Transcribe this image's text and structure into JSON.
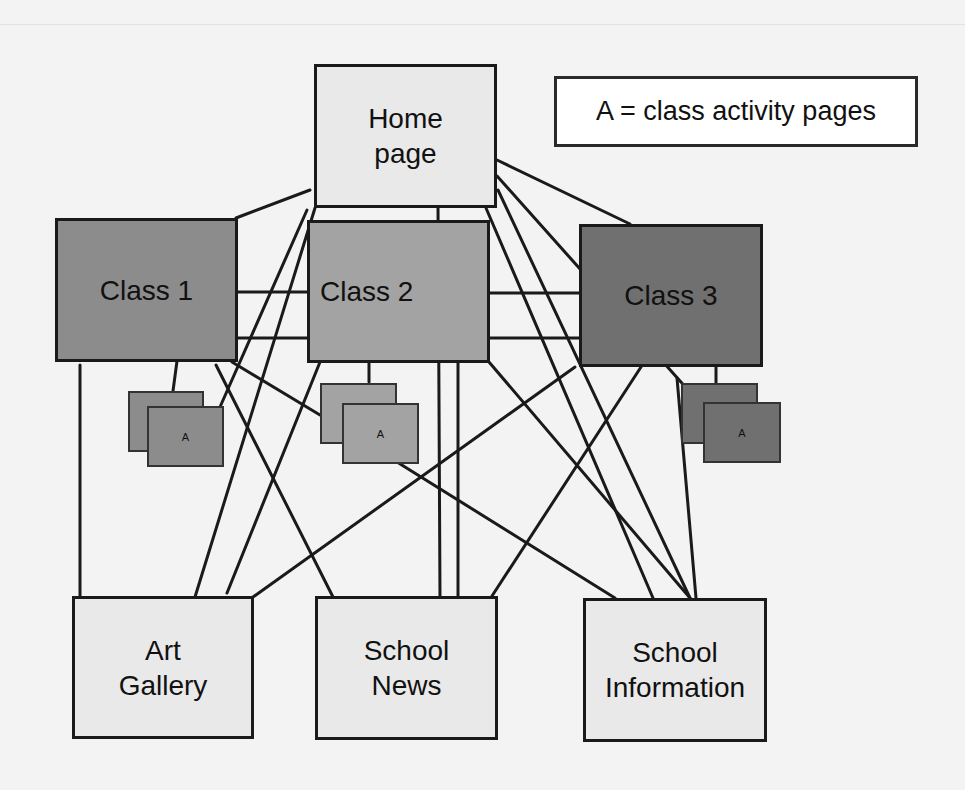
{
  "diagram": {
    "legend": {
      "text": "A = class activity pages"
    },
    "nodes": {
      "home": {
        "label": "Home\npage",
        "color": "#e9e9e9"
      },
      "class1": {
        "label": "Class 1",
        "color": "#8c8c8c"
      },
      "class2": {
        "label": "Class 2",
        "color": "#a3a3a3"
      },
      "class3": {
        "label": "Class 3",
        "color": "#707070"
      },
      "art": {
        "label": "Art\nGallery",
        "color": "#e9e9e9"
      },
      "news": {
        "label": "School\nNews",
        "color": "#e9e9e9"
      },
      "info": {
        "label": "School\nInformation",
        "color": "#e9e9e9"
      }
    },
    "activity_pages": [
      {
        "parent": "Class 1",
        "label": "A",
        "color": "#8c8c8c"
      },
      {
        "parent": "Class 2",
        "label": "A",
        "color": "#a3a3a3"
      },
      {
        "parent": "Class 3",
        "label": "A",
        "color": "#707070"
      }
    ],
    "edges": [
      [
        "Home page",
        "Class 1"
      ],
      [
        "Home page",
        "Class 2"
      ],
      [
        "Home page",
        "Class 3"
      ],
      [
        "Home page",
        "Art Gallery"
      ],
      [
        "Home page",
        "School News"
      ],
      [
        "Home page",
        "School Information"
      ],
      [
        "Class 1",
        "Class 2"
      ],
      [
        "Class 1",
        "Class 3"
      ],
      [
        "Class 2",
        "Class 3"
      ],
      [
        "Class 1",
        "Art Gallery"
      ],
      [
        "Class 1",
        "School News"
      ],
      [
        "Class 1",
        "School Information"
      ],
      [
        "Class 2",
        "Art Gallery"
      ],
      [
        "Class 2",
        "School News"
      ],
      [
        "Class 2",
        "School Information"
      ],
      [
        "Class 3",
        "Art Gallery"
      ],
      [
        "Class 3",
        "School News"
      ],
      [
        "Class 3",
        "School Information"
      ]
    ],
    "line_color": "#1a1a1a"
  }
}
